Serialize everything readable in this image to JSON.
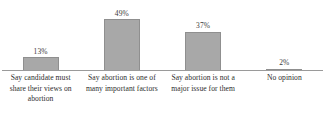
{
  "chart_data": {
    "type": "bar",
    "title": "",
    "subtitle": "",
    "xlabel": "",
    "ylabel": "",
    "ylim": [
      0,
      55
    ],
    "grid": false,
    "legend": false,
    "orientation": "vertical",
    "bar_color": "#a8a8a8",
    "bar_border_color": "#8f8f8f",
    "axis_color": "#9a9a9a",
    "value_suffix": "%",
    "categories": [
      "Say candidate must share their views on abortion",
      "Say abortion is one of many important factors",
      "Say abortion is not a major issue for them",
      "No opinion"
    ],
    "values": [
      13,
      49,
      37,
      2
    ],
    "value_labels": [
      "13%",
      "49%",
      "37%",
      "2%"
    ],
    "points": [
      {
        "category": "Say candidate must share their views on abortion",
        "value": 13,
        "label": "13%"
      },
      {
        "category": "Say abortion is one of many important factors",
        "value": 49,
        "label": "49%"
      },
      {
        "category": "Say abortion is not a major issue for them",
        "value": 37,
        "label": "37%"
      },
      {
        "category": "No opinion",
        "value": 2,
        "label": "2%"
      }
    ]
  }
}
